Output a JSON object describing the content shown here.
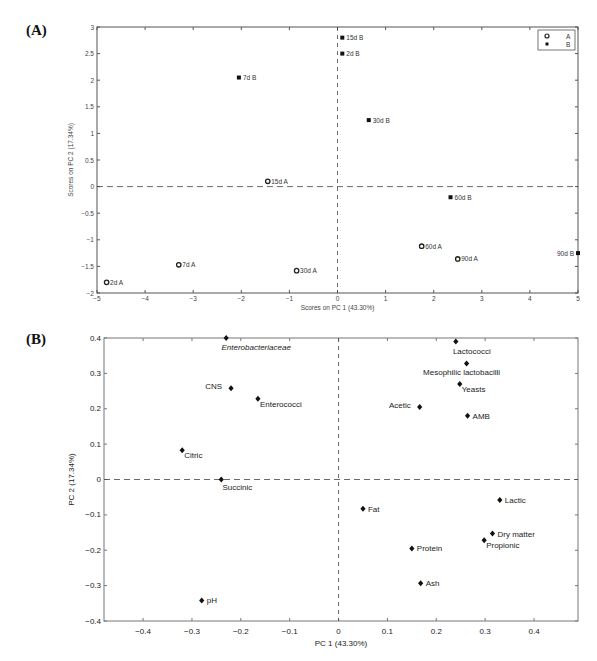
{
  "panels": {
    "a_label": "(A)",
    "b_label": "(B)"
  },
  "chart_data": [
    {
      "id": "A",
      "type": "scatter",
      "title": "",
      "xlabel": "Scores on PC 1 (43.30%)",
      "ylabel": "Scores on PC 2 (17.34%)",
      "xlim": [
        -5,
        5
      ],
      "ylim": [
        -2,
        3
      ],
      "xticks": [
        -5,
        -4,
        -3,
        -2,
        -1,
        0,
        1,
        2,
        3,
        4,
        5
      ],
      "yticks": [
        -2,
        -1.5,
        -1,
        -0.5,
        0,
        0.5,
        1,
        1.5,
        2,
        2.5,
        3
      ],
      "grid": false,
      "zero_lines": true,
      "legend": {
        "position": "top-right",
        "entries": [
          {
            "name": "A",
            "marker": "circle-open"
          },
          {
            "name": "B",
            "marker": "square-filled"
          }
        ]
      },
      "series": [
        {
          "name": "A",
          "marker": "circle-open",
          "points": [
            {
              "label": "2d A",
              "x": -4.8,
              "y": -1.8
            },
            {
              "label": "7d A",
              "x": -3.3,
              "y": -1.47
            },
            {
              "label": "15d A",
              "x": -1.45,
              "y": 0.1
            },
            {
              "label": "30d A",
              "x": -0.85,
              "y": -1.58
            },
            {
              "label": "60d A",
              "x": 1.75,
              "y": -1.12
            },
            {
              "label": "90d A",
              "x": 2.5,
              "y": -1.36
            }
          ]
        },
        {
          "name": "B",
          "marker": "square-filled",
          "points": [
            {
              "label": "2d B",
              "x": 0.1,
              "y": 2.5
            },
            {
              "label": "7d B",
              "x": -2.05,
              "y": 2.05
            },
            {
              "label": "15d B",
              "x": 0.1,
              "y": 2.8
            },
            {
              "label": "30d B",
              "x": 0.65,
              "y": 1.25
            },
            {
              "label": "60d B",
              "x": 2.35,
              "y": -0.2
            },
            {
              "label": "90d B",
              "x": 5.0,
              "y": -1.25
            }
          ]
        }
      ]
    },
    {
      "id": "B",
      "type": "scatter",
      "title": "",
      "xlabel": "PC 1 (43.30%)",
      "ylabel": "PC 2 (17.34%)",
      "xlim": [
        -0.48,
        0.49
      ],
      "ylim": [
        -0.4,
        0.4
      ],
      "xticks": [
        -0.4,
        -0.3,
        -0.2,
        -0.1,
        0,
        0.1,
        0.2,
        0.3,
        0.4
      ],
      "yticks": [
        -0.4,
        -0.3,
        -0.2,
        -0.1,
        0,
        0.1,
        0.2,
        0.3,
        0.4
      ],
      "grid": false,
      "zero_lines": true,
      "series": [
        {
          "name": "loadings",
          "marker": "diamond-filled",
          "points": [
            {
              "label": "Enterobacteriaceae",
              "x": -0.23,
              "y": 0.4,
              "italic": true,
              "pos": "below"
            },
            {
              "label": "CNS",
              "x": -0.22,
              "y": 0.258,
              "pos": "left"
            },
            {
              "label": "Enterococci",
              "x": -0.165,
              "y": 0.228,
              "pos": "below-right"
            },
            {
              "label": "Citric",
              "x": -0.32,
              "y": 0.083,
              "pos": "below-right"
            },
            {
              "label": "Succinic",
              "x": -0.24,
              "y": 0.0,
              "pos": "below"
            },
            {
              "label": "pH",
              "x": -0.28,
              "y": -0.342,
              "pos": "right"
            },
            {
              "label": "Lactococci",
              "x": 0.24,
              "y": 0.39,
              "pos": "below"
            },
            {
              "label": "Mesophilic lactobacilli",
              "x": 0.262,
              "y": 0.328,
              "pos": "below"
            },
            {
              "label": "Yeasts",
              "x": 0.248,
              "y": 0.27,
              "pos": "below-right"
            },
            {
              "label": "Acetic",
              "x": 0.166,
              "y": 0.205,
              "pos": "left"
            },
            {
              "label": "AMB",
              "x": 0.264,
              "y": 0.18,
              "pos": "right"
            },
            {
              "label": "Lactic",
              "x": 0.33,
              "y": -0.058,
              "pos": "right"
            },
            {
              "label": "Fat",
              "x": 0.05,
              "y": -0.083,
              "pos": "right"
            },
            {
              "label": "Dry matter",
              "x": 0.315,
              "y": -0.153,
              "pos": "right"
            },
            {
              "label": "Propionic",
              "x": 0.298,
              "y": -0.172,
              "pos": "below-right"
            },
            {
              "label": "Protein",
              "x": 0.15,
              "y": -0.195,
              "pos": "right"
            },
            {
              "label": "Ash",
              "x": 0.168,
              "y": -0.293,
              "pos": "right"
            }
          ]
        }
      ]
    }
  ]
}
